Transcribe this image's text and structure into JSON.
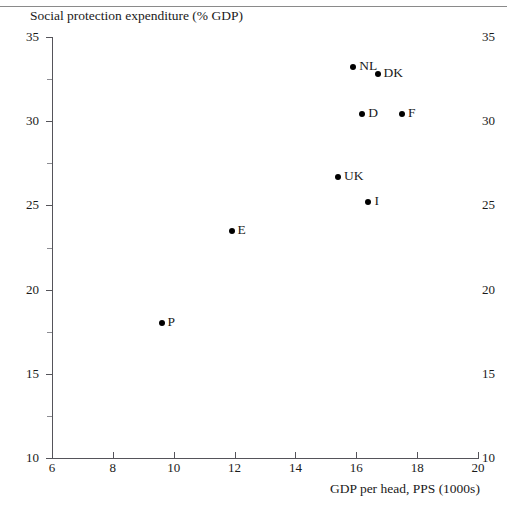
{
  "chart_data": {
    "type": "scatter",
    "title": "",
    "ylabel": "Social protection expenditure (% GDP)",
    "xlabel": "GDP per head, PPS (1000s)",
    "xlim": [
      6,
      20
    ],
    "ylim": [
      10,
      35
    ],
    "xticks": [
      6,
      8,
      10,
      12,
      14,
      16,
      18,
      20
    ],
    "xtick_labels": [
      "6",
      "8",
      "10",
      "12",
      "14",
      "16",
      "18",
      "20"
    ],
    "yticks": [
      10,
      15,
      20,
      25,
      30,
      35
    ],
    "ytick_labels": [
      "10",
      "15",
      "20",
      "25",
      "30",
      "35"
    ],
    "y_minor_ticks": [
      12.5,
      17.5,
      22.5,
      27.5,
      32.5
    ],
    "right_axis_labels": [
      "35",
      "30",
      "25",
      "20",
      "15",
      "10"
    ],
    "grid": false,
    "legend": "none",
    "marker_color": "#000000",
    "axis_color": "#55545a",
    "points": [
      {
        "label": "NL",
        "x": 15.9,
        "y": 33.2
      },
      {
        "label": "DK",
        "x": 16.7,
        "y": 32.8
      },
      {
        "label": "D",
        "x": 16.2,
        "y": 30.4
      },
      {
        "label": "F",
        "x": 17.5,
        "y": 30.4
      },
      {
        "label": "UK",
        "x": 15.4,
        "y": 26.7
      },
      {
        "label": "I",
        "x": 16.4,
        "y": 25.2
      },
      {
        "label": "E",
        "x": 11.9,
        "y": 23.5
      },
      {
        "label": "P",
        "x": 9.6,
        "y": 18.0
      }
    ]
  }
}
